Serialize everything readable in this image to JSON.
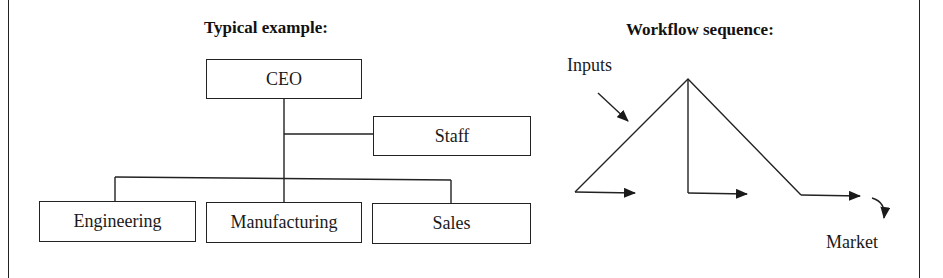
{
  "org_chart": {
    "title": "Typical example:",
    "root": "CEO",
    "staff": "Staff",
    "departments": [
      "Engineering",
      "Manufacturing",
      "Sales"
    ]
  },
  "workflow": {
    "title": "Workflow sequence:",
    "input_label": "Inputs",
    "output_label": "Market"
  },
  "colors": {
    "line": "#222222",
    "background": "#ffffff"
  }
}
